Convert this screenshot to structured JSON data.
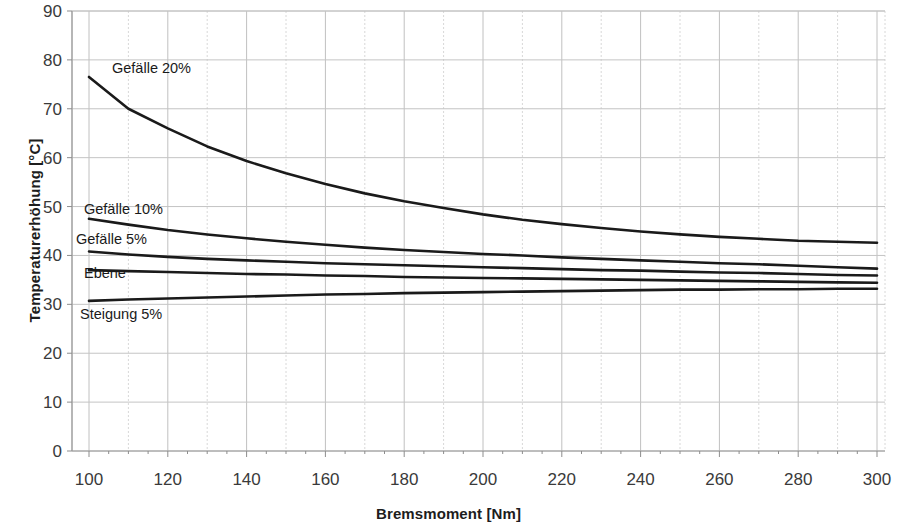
{
  "chart_data": {
    "type": "line",
    "title": "",
    "xlabel": "Bremsmoment [Nm]",
    "ylabel": "Temperaturerhöhung [°C]",
    "xlim": [
      100,
      300
    ],
    "ylim": [
      0,
      90
    ],
    "xticks": [
      100,
      120,
      140,
      160,
      180,
      200,
      220,
      240,
      260,
      280,
      300
    ],
    "yticks": [
      0,
      10,
      20,
      30,
      40,
      50,
      60,
      70,
      80,
      90
    ],
    "grid": true,
    "minor_grid_x_step": 10,
    "legend_position": "inline-labels",
    "line_color": "#1a1a1a",
    "grid_color": "#c8c8c8",
    "x": [
      100,
      110,
      120,
      130,
      140,
      150,
      160,
      170,
      180,
      190,
      200,
      210,
      220,
      230,
      240,
      250,
      260,
      270,
      280,
      290,
      300
    ],
    "series": [
      {
        "name": "Gefälle 20%",
        "label": "Gefälle 20%",
        "values": [
          76.5,
          70.0,
          66.0,
          62.3,
          59.3,
          56.8,
          54.6,
          52.7,
          51.1,
          49.7,
          48.4,
          47.3,
          46.4,
          45.6,
          44.9,
          44.3,
          43.8,
          43.4,
          43.0,
          42.8,
          42.6
        ]
      },
      {
        "name": "Gefälle 10%",
        "label": "Gefälle 10%",
        "values": [
          47.5,
          46.3,
          45.2,
          44.3,
          43.5,
          42.8,
          42.2,
          41.6,
          41.1,
          40.7,
          40.3,
          40.0,
          39.6,
          39.3,
          39.0,
          38.7,
          38.4,
          38.2,
          37.9,
          37.6,
          37.3
        ]
      },
      {
        "name": "Gefälle 5%",
        "label": "Gefälle 5%",
        "values": [
          40.8,
          40.2,
          39.7,
          39.3,
          39.0,
          38.7,
          38.4,
          38.2,
          38.0,
          37.8,
          37.6,
          37.4,
          37.2,
          37.0,
          36.9,
          36.7,
          36.5,
          36.4,
          36.2,
          36.0,
          35.9
        ]
      },
      {
        "name": "Ebene",
        "label": "Ebene",
        "values": [
          37.0,
          36.8,
          36.6,
          36.4,
          36.2,
          36.1,
          35.9,
          35.8,
          35.6,
          35.5,
          35.4,
          35.3,
          35.2,
          35.1,
          35.0,
          34.9,
          34.8,
          34.7,
          34.6,
          34.5,
          34.4
        ]
      },
      {
        "name": "Steigung 5%",
        "label": "Steigung 5%",
        "values": [
          30.7,
          31.0,
          31.2,
          31.4,
          31.6,
          31.8,
          32.0,
          32.1,
          32.3,
          32.4,
          32.5,
          32.6,
          32.7,
          32.8,
          32.9,
          33.0,
          33.0,
          33.1,
          33.1,
          33.2,
          33.2
        ]
      }
    ],
    "annotations": [
      {
        "text": "Gefälle 20%",
        "x_px": 112,
        "y_px": 61
      },
      {
        "text": "Gefälle 10%",
        "x_px": 84,
        "y_px": 202
      },
      {
        "text": "Gefälle 5%",
        "x_px": 76,
        "y_px": 232
      },
      {
        "text": "Ebene",
        "x_px": 84,
        "y_px": 266
      },
      {
        "text": "Steigung 5%",
        "x_px": 80,
        "y_px": 307
      }
    ]
  }
}
